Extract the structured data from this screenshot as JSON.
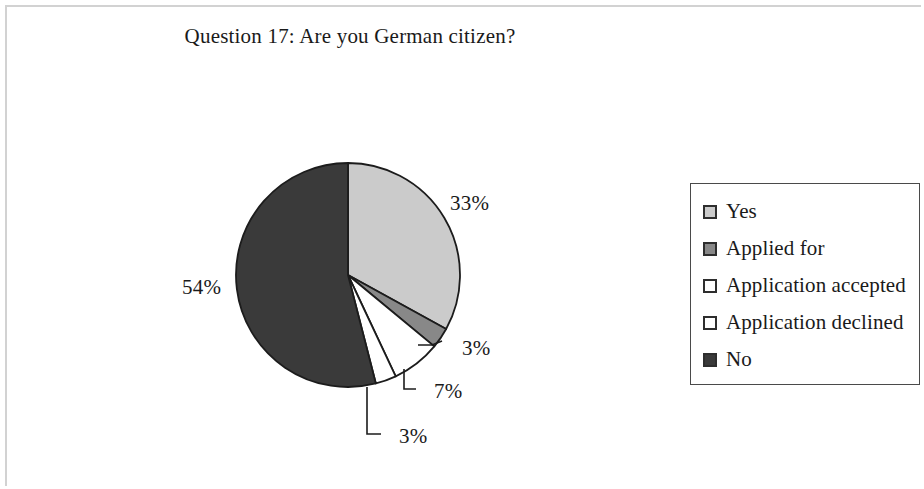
{
  "figure": {
    "background_color": "#ffffff",
    "frame_color": "#d2d2d2"
  },
  "chart_data": {
    "type": "pie",
    "title": "Question 17: Are you German citizen?",
    "xlabel": "",
    "ylabel": "",
    "unit": "%",
    "start_angle_deg": 0,
    "direction": "clockwise",
    "grid": false,
    "legend_position": "right",
    "categories": [
      "Yes",
      "Applied for",
      "Application accepted",
      "Application declined",
      "No"
    ],
    "values": [
      33,
      3,
      7,
      3,
      54
    ],
    "labels": [
      "33%",
      "3%",
      "7%",
      "3%",
      "54%"
    ],
    "colors": [
      "#cbcbcb",
      "#888888",
      "#ffffff",
      "#ffffff",
      "#3a3a3a"
    ],
    "slice_border_color": "#1c1c1c",
    "slices": [
      {
        "name": "Yes",
        "value": 33,
        "label": "33%",
        "color": "#cbcbcb",
        "start_deg": 0.0,
        "end_deg": 118.8
      },
      {
        "name": "Applied for",
        "value": 3,
        "label": "3%",
        "color": "#888888",
        "start_deg": 118.8,
        "end_deg": 129.6
      },
      {
        "name": "Application accepted",
        "value": 7,
        "label": "7%",
        "color": "#ffffff",
        "start_deg": 129.6,
        "end_deg": 154.8
      },
      {
        "name": "Application declined",
        "value": 3,
        "label": "3%",
        "color": "#ffffff",
        "start_deg": 154.8,
        "end_deg": 165.6
      },
      {
        "name": "No",
        "value": 54,
        "label": "54%",
        "color": "#3a3a3a",
        "start_deg": 165.6,
        "end_deg": 360.0
      }
    ]
  },
  "legend": {
    "border_color": "#4a4a4a",
    "items": [
      {
        "label": "Yes",
        "color": "#cbcbcb"
      },
      {
        "label": "Applied for",
        "color": "#888888"
      },
      {
        "label": "Application accepted",
        "color": "#ffffff"
      },
      {
        "label": "Application declined",
        "color": "#ffffff"
      },
      {
        "label": "No",
        "color": "#3a3a3a"
      }
    ]
  }
}
